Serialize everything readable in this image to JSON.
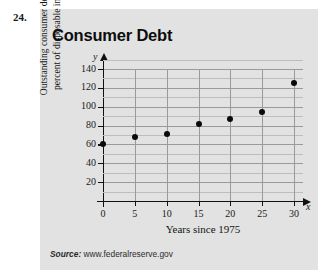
{
  "problem": {
    "number": "24."
  },
  "chart_data": {
    "type": "scatter",
    "title": "Consumer Debt",
    "xlabel": "Years since 1975",
    "ylabel_line1": "Outstanding consumer debt as a",
    "ylabel_line2": "percent of disposable income",
    "x_axis_variable": "x",
    "y_axis_variable": "y",
    "xlim": [
      0,
      30
    ],
    "ylim": [
      0,
      150
    ],
    "xticks": [
      "0",
      "5",
      "10",
      "15",
      "20",
      "25",
      "30"
    ],
    "xtick_values": [
      0,
      5,
      10,
      15,
      20,
      25,
      30
    ],
    "yticks": [
      "20",
      "40",
      "60",
      "80",
      "100",
      "120",
      "140"
    ],
    "ytick_values": [
      20,
      40,
      60,
      80,
      100,
      120,
      140
    ],
    "grid": true,
    "grid_minor_y": true,
    "legend": "none",
    "x": [
      0,
      5,
      10,
      15,
      20,
      25,
      30
    ],
    "values": [
      60,
      68,
      71,
      82,
      87,
      94,
      125
    ],
    "points": [
      {
        "x": 0,
        "y": 60
      },
      {
        "x": 5,
        "y": 68
      },
      {
        "x": 10,
        "y": 71
      },
      {
        "x": 15,
        "y": 82
      },
      {
        "x": 20,
        "y": 87
      },
      {
        "x": 25,
        "y": 94
      },
      {
        "x": 30,
        "y": 125
      }
    ],
    "marker_color": "#0a0a0a",
    "panel_color": "#e2e2e2",
    "grid_color": "#9a9a9a"
  },
  "source": {
    "label": "Source:",
    "url": "www.federalreserve.gov"
  }
}
